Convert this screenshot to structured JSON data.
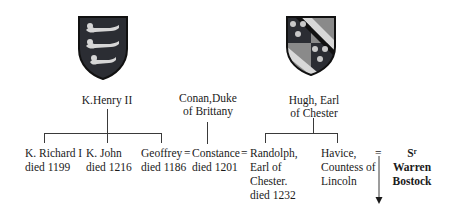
{
  "diagram": {
    "type": "family-tree",
    "parents": [
      {
        "id": "henry",
        "label": "K.Henry II",
        "shield": "three-lions-shield"
      },
      {
        "id": "conan",
        "line1": "Conan,Duke",
        "line2": "of Brittany"
      },
      {
        "id": "hugh",
        "line1": "Hugh, Earl",
        "line2": "of Chester",
        "shield": "checkered-bend-shield"
      }
    ],
    "children": [
      {
        "id": "richard",
        "line1": "K. Richard I",
        "line2": "died 1199"
      },
      {
        "id": "john",
        "line1": "K. John",
        "line2": "died 1216"
      },
      {
        "id": "geoffrey",
        "line1": "Geoffrey",
        "line2": "died 1186"
      },
      {
        "id": "constance",
        "line1": "Constance",
        "line2": "died 1201"
      },
      {
        "id": "randolph",
        "line1": "Randolph,",
        "line2": "Earl of",
        "line3": "Chester.",
        "line4": "died 1232"
      },
      {
        "id": "havice",
        "line1": "Havice,",
        "line2": "Countess of",
        "line3": "Lincoln"
      },
      {
        "id": "warren",
        "line1": "Sʳ",
        "line2": "Warren",
        "line3": "Bostock"
      }
    ],
    "marriage_symbol": "=",
    "colors": {
      "line": "#3a3a3a",
      "text": "#1a1a1a",
      "shield_dark": "#2b2d33",
      "shield_light": "#d8d8d8"
    }
  }
}
